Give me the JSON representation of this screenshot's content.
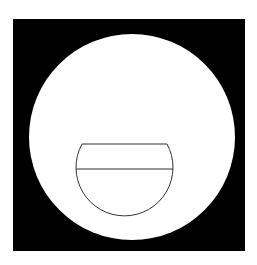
{
  "figure": {
    "background": "#ffffff",
    "frame": {
      "x": 13,
      "y": 19,
      "width": 232,
      "height": 232,
      "fill": "#000000"
    },
    "circle": {
      "cx": 132,
      "cy": 137,
      "r": 103,
      "fill": "#ffffff"
    },
    "bowl": {
      "stroke": "#333333",
      "stroke_width": 1,
      "rim": {
        "x1": 82,
        "y1": 144,
        "x2": 167,
        "y2": 144
      },
      "level": {
        "x1": 76,
        "y1": 169,
        "x2": 173,
        "y2": 169
      },
      "arc": {
        "cx": 124.5,
        "cy": 169,
        "r": 48.5
      }
    }
  }
}
